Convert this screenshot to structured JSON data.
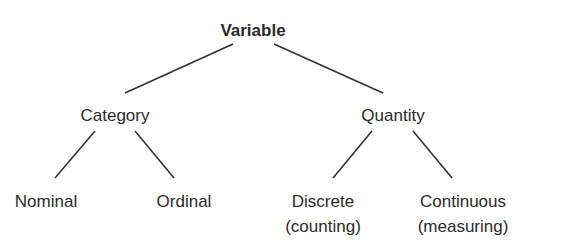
{
  "diagram": {
    "type": "tree",
    "line_color": "#333333",
    "nodes": {
      "root": {
        "label": "Variable",
        "bold": true,
        "x": 253,
        "y": 18
      },
      "category": {
        "label": "Category",
        "x": 115,
        "y": 103
      },
      "quantity": {
        "label": "Quantity",
        "x": 393,
        "y": 103
      },
      "nominal": {
        "label": "Nominal",
        "x": 46,
        "y": 189
      },
      "ordinal": {
        "label": "Ordinal",
        "x": 184,
        "y": 189
      },
      "discrete": {
        "label": "Discrete",
        "sublabel": "(counting)",
        "x": 323,
        "y": 189
      },
      "continuous": {
        "label": "Continuous",
        "sublabel": "(measuring)",
        "x": 463,
        "y": 189
      }
    },
    "edges": [
      {
        "from": "root",
        "to": "category",
        "x1": 233,
        "y1": 44,
        "x2": 125,
        "y2": 93
      },
      {
        "from": "root",
        "to": "quantity",
        "x1": 274,
        "y1": 44,
        "x2": 383,
        "y2": 93
      },
      {
        "from": "category",
        "to": "nominal",
        "x1": 95,
        "y1": 131,
        "x2": 55,
        "y2": 178
      },
      {
        "from": "category",
        "to": "ordinal",
        "x1": 135,
        "y1": 131,
        "x2": 174,
        "y2": 178
      },
      {
        "from": "quantity",
        "to": "discrete",
        "x1": 372,
        "y1": 131,
        "x2": 333,
        "y2": 178
      },
      {
        "from": "quantity",
        "to": "continuous",
        "x1": 413,
        "y1": 131,
        "x2": 452,
        "y2": 178
      }
    ]
  }
}
